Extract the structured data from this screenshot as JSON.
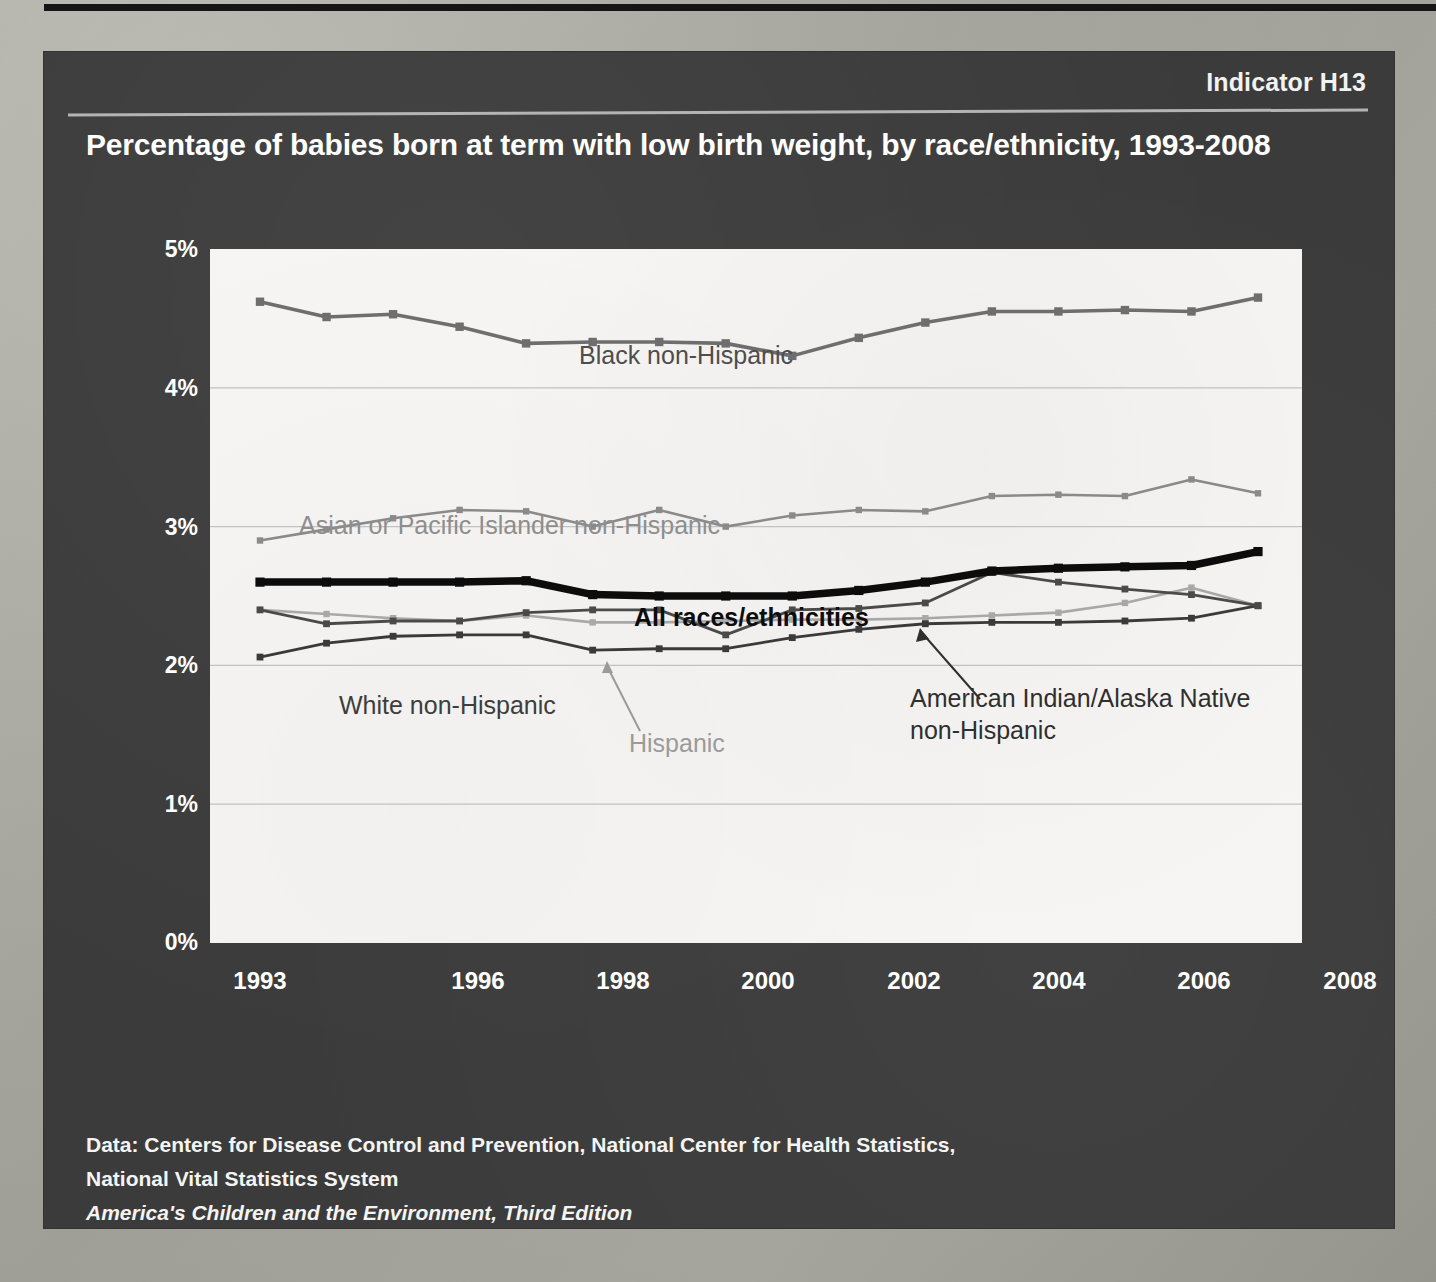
{
  "slide": {
    "indicator": "Indicator H13",
    "title": "Percentage of babies born at term with low birth weight, by race/ethnicity, 1993-2008",
    "footer": {
      "data_source_line1": "Data: Centers for Disease Control and Prevention, National Center for Health Statistics,",
      "data_source_line2": "National Vital Statistics System",
      "publication": "America's Children and the Environment, Third Edition"
    },
    "colors": {
      "panel": "#3b3b3b",
      "plot_background": "#f6f5f3",
      "black_non_hispanic": "#6e6e6e",
      "asian_pacific_islander": "#8a8a8a",
      "all_races": "#0c0c0c",
      "american_indian": "#4a4a4a",
      "hispanic": "#a8a8a8",
      "white_non_hispanic": "#3a3a3a"
    }
  },
  "chart_data": {
    "type": "line",
    "title": "Percentage of babies born at term with low birth weight, by race/ethnicity, 1993-2008",
    "xlabel": "",
    "ylabel": "",
    "xlim": [
      1993,
      2008
    ],
    "ylim": [
      0,
      5
    ],
    "grid": true,
    "legend_position": "inline-annotations",
    "x": [
      1993,
      1994,
      1995,
      1996,
      1997,
      1998,
      1999,
      2000,
      2001,
      2002,
      2003,
      2004,
      2005,
      2006,
      2007,
      2008
    ],
    "xticks": [
      "1993",
      "1996",
      "1998",
      "2000",
      "2002",
      "2004",
      "2006",
      "2008"
    ],
    "xtick_values": [
      1993,
      1996,
      1998,
      2000,
      2002,
      2004,
      2006,
      2008
    ],
    "yticks": [
      "0%",
      "1%",
      "2%",
      "3%",
      "4%",
      "5%"
    ],
    "ytick_values": [
      0,
      1,
      2,
      3,
      4,
      5
    ],
    "series": [
      {
        "name": "Black non-Hispanic",
        "label": "Black non-Hispanic",
        "color": "#6e6e6e",
        "values": [
          4.62,
          4.51,
          4.53,
          4.44,
          4.32,
          4.33,
          4.33,
          4.32,
          4.23,
          4.36,
          4.47,
          4.55,
          4.55,
          4.56,
          4.55,
          4.65
        ]
      },
      {
        "name": "Asian or Pacific Islander non-Hispanic",
        "label": "Asian or Pacific Islander non-Hispanic",
        "color": "#8a8a8a",
        "values": [
          2.9,
          2.98,
          3.06,
          3.12,
          3.11,
          3.0,
          3.12,
          3.0,
          3.08,
          3.12,
          3.11,
          3.22,
          3.23,
          3.22,
          3.34,
          3.24
        ]
      },
      {
        "name": "All races/ethnicities",
        "label": "All races/ethnicities",
        "color": "#0c0c0c",
        "values": [
          2.6,
          2.6,
          2.6,
          2.6,
          2.61,
          2.51,
          2.5,
          2.5,
          2.5,
          2.54,
          2.6,
          2.68,
          2.7,
          2.71,
          2.72,
          2.82
        ]
      },
      {
        "name": "American Indian/Alaska Native non-Hispanic",
        "label": "American Indian/Alaska Native non-Hispanic",
        "color": "#4a4a4a",
        "values": [
          2.4,
          2.3,
          2.32,
          2.32,
          2.38,
          2.4,
          2.4,
          2.22,
          2.4,
          2.41,
          2.45,
          2.67,
          2.6,
          2.55,
          2.51,
          2.43
        ]
      },
      {
        "name": "Hispanic",
        "label": "Hispanic",
        "color": "#a8a8a8",
        "values": [
          2.4,
          2.37,
          2.34,
          2.32,
          2.36,
          2.31,
          2.31,
          2.32,
          2.33,
          2.33,
          2.34,
          2.36,
          2.38,
          2.45,
          2.56,
          2.43
        ]
      },
      {
        "name": "White non-Hispanic",
        "label": "White non-Hispanic",
        "color": "#3a3a3a",
        "values": [
          2.06,
          2.16,
          2.21,
          2.22,
          2.22,
          2.11,
          2.12,
          2.12,
          2.2,
          2.26,
          2.3,
          2.31,
          2.31,
          2.32,
          2.34,
          2.43
        ]
      }
    ],
    "annotations": [
      {
        "text": "Black non-Hispanic",
        "for": "Black non-Hispanic"
      },
      {
        "text": "Asian or Pacific Islander non-Hispanic",
        "for": "Asian or Pacific Islander non-Hispanic"
      },
      {
        "text": "All races/ethnicities",
        "for": "All races/ethnicities"
      },
      {
        "text": "White non-Hispanic",
        "for": "White non-Hispanic"
      },
      {
        "text": "Hispanic",
        "for": "Hispanic",
        "leader_line": true
      },
      {
        "text": "American Indian/Alaska Native non-Hispanic",
        "for": "American Indian/Alaska Native non-Hispanic",
        "leader_line": true
      }
    ]
  },
  "axis_labels": {
    "y": [
      "5%",
      "4%",
      "3%",
      "2%",
      "1%",
      "0%"
    ],
    "x": [
      "1993",
      "1996",
      "1998",
      "2000",
      "2002",
      "2004",
      "2006",
      "2008"
    ]
  },
  "annotation_text": {
    "black": "Black non-Hispanic",
    "asian": "Asian or Pacific Islander non-Hispanic",
    "all": "All races/ethnicities",
    "white": "White non-Hispanic",
    "hispanic": "Hispanic",
    "aian_line1": "American Indian/Alaska Native",
    "aian_line2": "non-Hispanic"
  }
}
